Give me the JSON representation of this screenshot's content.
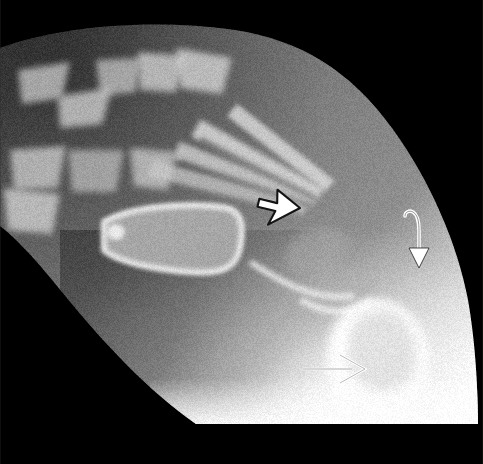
{
  "image": {
    "kind": "radiograph",
    "modality": "X-ray",
    "view": "lateral-oblique foot",
    "subject": "pediatric foot",
    "width": 483,
    "height": 464,
    "background_color": "#000000",
    "film_border_color": "#050505"
  },
  "palette": {
    "background": "#000000",
    "soft_tissue_dark": "#3a3a3a",
    "soft_tissue_mid": "#6e6e6e",
    "soft_tissue_light": "#9a9a9a",
    "bone_mid": "#b4b4b4",
    "bone_bright": "#e2e2e2",
    "bone_brightest": "#ffffff",
    "annotation_fill": "#ffffff",
    "annotation_stroke": "#1a1a1a"
  },
  "annotations": [
    {
      "id": "arrow-cursor",
      "name": "open-arrowhead-pointer",
      "style": "cursor-arrowhead",
      "direction": "up-left",
      "rotation_deg": 133,
      "x": 300,
      "y": 208,
      "length": 42,
      "fill": "#ffffff",
      "stroke": "#151515",
      "label": ""
    },
    {
      "id": "arrow-curved",
      "name": "curved-hook-arrow",
      "style": "curved-down",
      "direction": "down",
      "x": 404,
      "y": 212,
      "length": 58,
      "fill": "#ffffff",
      "stroke": "#151515",
      "label": ""
    },
    {
      "id": "arrow-right",
      "name": "open-line-arrow",
      "style": "outline-chevron",
      "direction": "right",
      "x": 303,
      "y": 369,
      "length": 62,
      "fill": "none",
      "stroke": "#ffffff",
      "label": ""
    }
  ],
  "anatomy": {
    "structures": [
      {
        "name": "phalanges",
        "region": "upper-left",
        "count": 5
      },
      {
        "name": "metatarsals",
        "region": "center-left",
        "count": 5
      },
      {
        "name": "first-metatarsal-shaft",
        "region": "center"
      },
      {
        "name": "tarsal-bones",
        "region": "center-right"
      },
      {
        "name": "calcaneal-ossification-center",
        "region": "lower-right"
      },
      {
        "name": "soft-tissue-envelope",
        "region": "whole"
      }
    ]
  },
  "noise": {
    "grain_opacity": 0.22,
    "grain_scale": 1
  }
}
